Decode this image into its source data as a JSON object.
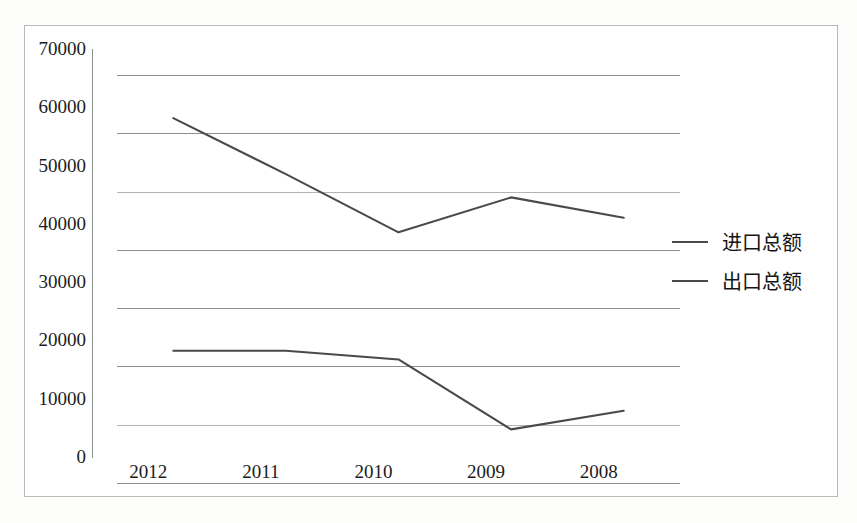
{
  "chart_data": {
    "type": "line",
    "title": "",
    "xlabel": "",
    "ylabel": "",
    "categories": [
      "2012",
      "2011",
      "2010",
      "2009",
      "2008"
    ],
    "x_tick_labels": [
      "2012",
      "2011",
      "2010",
      "2009",
      "2008"
    ],
    "y_tick_labels": [
      "70000",
      "60000",
      "50000",
      "40000",
      "30000",
      "20000",
      "10000",
      "0"
    ],
    "y_tick_values": [
      70000,
      60000,
      50000,
      40000,
      30000,
      20000,
      10000,
      0
    ],
    "ylim": [
      0,
      70000
    ],
    "y_tick_step": 10000,
    "grid": "horizontal",
    "legend_position": "right",
    "series": [
      {
        "name": "进口总额",
        "values": [
          62600,
          53000,
          43000,
          49000,
          45500
        ],
        "color": "#4a4a4a"
      },
      {
        "name": "出口总额",
        "values": [
          22700,
          22700,
          21200,
          9200,
          12400
        ],
        "color": "#4a4a4a"
      }
    ]
  },
  "legend": {
    "items": [
      {
        "label": "进口总额",
        "swatch": "line-swatch-solid"
      },
      {
        "label": "出口总额",
        "swatch": "line-swatch-solid"
      }
    ]
  },
  "axes": {
    "y_ticks": [
      {
        "label": "70000",
        "value": 70000
      },
      {
        "label": "60000",
        "value": 60000
      },
      {
        "label": "50000",
        "value": 50000
      },
      {
        "label": "40000",
        "value": 40000
      },
      {
        "label": "30000",
        "value": 30000
      },
      {
        "label": "20000",
        "value": 20000
      },
      {
        "label": "10000",
        "value": 10000
      },
      {
        "label": "0",
        "value": 0
      }
    ],
    "x_ticks": [
      {
        "label": "2012"
      },
      {
        "label": "2011"
      },
      {
        "label": "2010"
      },
      {
        "label": "2009"
      },
      {
        "label": "2008"
      }
    ]
  },
  "colors": {
    "line": "#4a4a4a",
    "gridline": "#8e8e8e",
    "gridline_faint": "#b4b4b4",
    "frame": "#b9b9b9",
    "text": "#1c1c1c",
    "background": "#ffffff"
  }
}
